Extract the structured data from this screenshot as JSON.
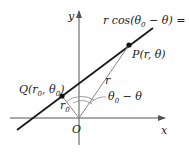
{
  "diagram": {
    "axes": {
      "x_label": "x",
      "y_label": "y",
      "origin_label": "O"
    },
    "equation": {
      "pre": "r cos(θ",
      "sub1": "0",
      "mid": " − θ) = r",
      "sub2": "0"
    },
    "point_p": {
      "label": "P(r, θ)"
    },
    "point_q": {
      "pre": "Q(r",
      "sub1": "0",
      "mid": ", θ",
      "sub2": "0",
      "post": ")"
    },
    "segment_r": {
      "label": "r"
    },
    "segment_r0": {
      "pre": "r",
      "sub": "0"
    },
    "angle": {
      "pre": "θ",
      "sub": "0",
      "post": " − θ"
    },
    "colors": {
      "line": "#1a1a1a",
      "axis": "#555555",
      "segment": "#888888"
    }
  }
}
